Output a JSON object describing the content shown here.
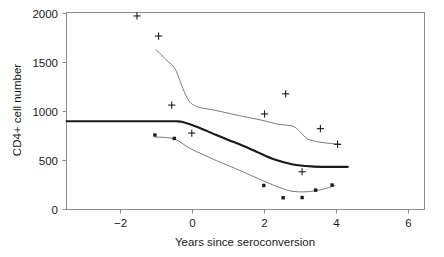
{
  "chart_data": {
    "type": "line",
    "title": "",
    "xlabel": "Years since seroconversion",
    "ylabel": "CD4+ cell number",
    "xlim": [
      -3.2,
      6.6
    ],
    "ylim": [
      -60,
      2100
    ],
    "xticks": [
      -2,
      0,
      2,
      4,
      6
    ],
    "xtick_labels": [
      "−2",
      "0",
      "2",
      "4",
      "6"
    ],
    "yticks": [
      0,
      500,
      1000,
      1500,
      2000
    ],
    "ytick_labels": [
      "0",
      "500",
      "1000",
      "1500",
      "2000"
    ],
    "grid": false,
    "legend": "none",
    "colors": {
      "thin_line": "#7a7a7a",
      "thick_line": "#1a1a1a",
      "frame": "#8c8c8c",
      "background": "#ffffff",
      "marker": "#1a1a1a"
    },
    "series": [
      {
        "name": "upper smoothed curve",
        "style": "thin-line",
        "x": [
          -0.75,
          -0.45,
          -0.22,
          0.05,
          0.3,
          0.9,
          1.5,
          2.1,
          2.6,
          3.0,
          3.2,
          3.4,
          3.7,
          4.0,
          4.3
        ],
        "y": [
          1630,
          1520,
          1430,
          1180,
          1060,
          1010,
          960,
          915,
          870,
          850,
          790,
          720,
          690,
          675,
          665
        ]
      },
      {
        "name": "population mean curve",
        "style": "thick-line",
        "x": [
          -3.2,
          -2.0,
          -1.0,
          -0.2,
          0.0,
          0.4,
          0.9,
          1.5,
          2.0,
          2.5,
          3.0,
          3.5,
          4.0,
          4.5
        ],
        "y": [
          900,
          900,
          900,
          900,
          890,
          840,
          760,
          670,
          590,
          510,
          460,
          440,
          435,
          435
        ]
      },
      {
        "name": "lower smoothed curve",
        "style": "thin-line",
        "x": [
          -0.78,
          -0.25,
          0.2,
          0.9,
          1.6,
          2.2,
          2.7,
          3.0,
          3.3,
          3.6,
          3.9,
          4.15
        ],
        "y": [
          740,
          720,
          620,
          500,
          390,
          290,
          215,
          185,
          180,
          190,
          215,
          245
        ]
      }
    ],
    "markers": [
      {
        "name": "plus-markers",
        "symbol": "+",
        "points": [
          {
            "x": -1.27,
            "y": 1975
          },
          {
            "x": -0.68,
            "y": 1770
          },
          {
            "x": -0.32,
            "y": 1065
          },
          {
            "x": 0.23,
            "y": 780
          },
          {
            "x": 2.22,
            "y": 975
          },
          {
            "x": 2.8,
            "y": 1180
          },
          {
            "x": 3.25,
            "y": 385
          },
          {
            "x": 3.75,
            "y": 825
          },
          {
            "x": 4.22,
            "y": 665
          }
        ]
      },
      {
        "name": "square-markers",
        "symbol": "square",
        "points": [
          {
            "x": -0.78,
            "y": 760
          },
          {
            "x": -0.25,
            "y": 725
          },
          {
            "x": 2.2,
            "y": 245
          },
          {
            "x": 2.73,
            "y": 120
          },
          {
            "x": 3.25,
            "y": 122
          },
          {
            "x": 3.62,
            "y": 198
          },
          {
            "x": 4.07,
            "y": 250
          }
        ]
      }
    ]
  }
}
